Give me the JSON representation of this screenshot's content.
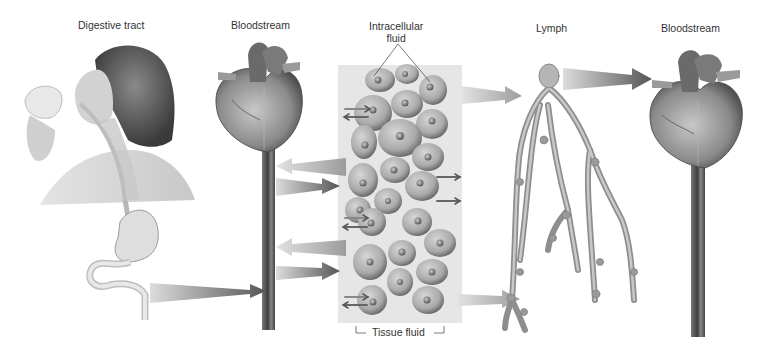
{
  "labels": {
    "digestive_tract": "Digestive tract",
    "bloodstream_left": "Bloodstream",
    "intracellular_line1": "Intracellular",
    "intracellular_line2": "fluid",
    "lymph": "Lymph",
    "bloodstream_right": "Bloodstream",
    "tissue_fluid": "Tissue fluid"
  },
  "colors": {
    "background": "#ffffff",
    "text": "#333333",
    "panel": "#e4e4e4",
    "cell_fill": "#b5b5b5",
    "cell_edge": "#5a5a5a",
    "arrow_dark": "#5a5a5a",
    "arrow_light": "#a8a8a8",
    "vessel": "#4a4a4a",
    "lymph_vessel": "#9a9a9a"
  }
}
